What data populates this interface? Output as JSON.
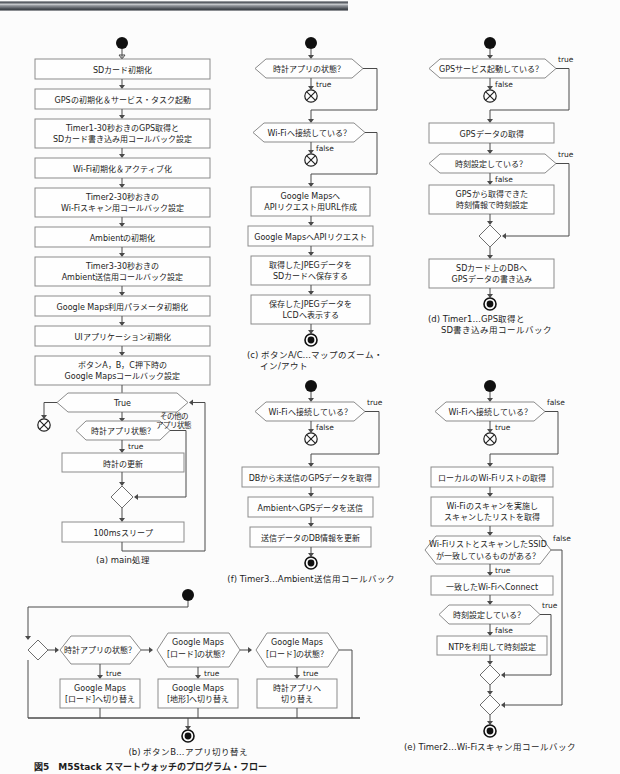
{
  "figure": {
    "number": "図5",
    "title": "M5Stack スマートウォッチのプログラム・フロー",
    "caption_full": "図5　M5Stack スマートウォッチのプログラム・フロー"
  },
  "diagram": {
    "type": "flowchart",
    "notation": "UML activity diagram",
    "panels": [
      {
        "id": "a",
        "label": "(a) main処理",
        "label_prefix": "(a)",
        "label_text": "main処理",
        "nodes": [
          {
            "kind": "start",
            "text": ""
          },
          {
            "kind": "action",
            "text": "SDカード初期化"
          },
          {
            "kind": "action",
            "text": "GPSの初期化＆サービス・タスク起動"
          },
          {
            "kind": "action",
            "text": "Timer1-30秒おきのGPS取得と\nSDカード書き込み用コールバック設定",
            "line1": "Timer1-30秒おきのGPS取得と",
            "line2": "SDカード書き込み用コールバック設定"
          },
          {
            "kind": "action",
            "text": "Wi-Fi初期化＆アクティブ化"
          },
          {
            "kind": "action",
            "text": "Timer2-30秒おきの\nWi-Fiスキャン用コールバック設定",
            "line1": "Timer2-30秒おきの",
            "line2": "Wi-Fiスキャン用コールバック設定"
          },
          {
            "kind": "action",
            "text": "Ambientの初期化"
          },
          {
            "kind": "action",
            "text": "Timer3-30秒おきの\nAmbient送信用コールバック設定",
            "line1": "Timer3-30秒おきの",
            "line2": "Ambient送信用コールバック設定"
          },
          {
            "kind": "action",
            "text": "Google Maps利用パラメータ初期化"
          },
          {
            "kind": "action",
            "text": "UIアプリケーション初期化"
          },
          {
            "kind": "action",
            "text": "ボタンA，B，C押下時の\nGoogle Mapsコールバック設定",
            "line1": "ボタンA，B，C押下時の",
            "line2": "Google Mapsコールバック設定"
          },
          {
            "kind": "decision",
            "text": "True"
          },
          {
            "kind": "decision",
            "text": "時計アプリ状態？"
          },
          {
            "kind": "action",
            "text": "時計の更新"
          },
          {
            "kind": "merge",
            "text": ""
          },
          {
            "kind": "action",
            "text": "100msスリープ"
          }
        ],
        "edge_labels": [
          {
            "text": "その他の",
            "role": "branch-false-line1"
          },
          {
            "text": "アプリ状態",
            "role": "branch-false-line2"
          },
          {
            "text": "true",
            "role": "branch-true"
          }
        ]
      },
      {
        "id": "b",
        "label": "(b) ボタンB…アプリ切り替え",
        "label_prefix": "(b)",
        "label_text": "ボタンB…アプリ切り替え",
        "nodes": [
          {
            "kind": "start",
            "text": ""
          },
          {
            "kind": "merge",
            "text": ""
          },
          {
            "kind": "decision",
            "text": "時計アプリの状態？"
          },
          {
            "kind": "decision",
            "text": "Google Maps\n[ロード]の状態？",
            "line1": "Google Maps",
            "line2": "[ロード]の状態？"
          },
          {
            "kind": "decision",
            "text": "Google Maps\n[ロード]の状態？",
            "line1": "Google Maps",
            "line2": "[ロード]の状態？"
          },
          {
            "kind": "action",
            "text": "Google Maps\n[ロード]へ切り替え",
            "line1": "Google Maps",
            "line2": "[ロード]へ切り替え"
          },
          {
            "kind": "action",
            "text": "Google Maps\n[地形]へ切り替え",
            "line1": "Google Maps",
            "line2": "[地形]へ切り替え"
          },
          {
            "kind": "action",
            "text": "時計アプリへ\n切り替え",
            "line1": "時計アプリへ",
            "line2": "切り替え"
          },
          {
            "kind": "end",
            "text": ""
          }
        ],
        "edge_labels": [
          {
            "text": "true",
            "role": "branch-true-1"
          },
          {
            "text": "true",
            "role": "branch-true-2"
          },
          {
            "text": "true",
            "role": "branch-true-3"
          }
        ]
      },
      {
        "id": "c",
        "label": "(c) ボタンA/C…マップのズーム・イン/アウト",
        "label_prefix": "(c)",
        "label_text_line1": "ボタンA/C…マップのズーム・",
        "label_text_line2": "イン/アウト",
        "nodes": [
          {
            "kind": "start",
            "text": ""
          },
          {
            "kind": "decision",
            "text": "時計アプリの状態？"
          },
          {
            "kind": "stop",
            "text": ""
          },
          {
            "kind": "decision",
            "text": "Wi-Fiへ接続している？"
          },
          {
            "kind": "stop",
            "text": ""
          },
          {
            "kind": "action",
            "text": "Google Mapsへ\nAPIリクエスト用URL作成",
            "line1": "Google Mapsへ",
            "line2": "APIリクエスト用URL作成"
          },
          {
            "kind": "action",
            "text": "Google MapsへAPIリクエスト"
          },
          {
            "kind": "action",
            "text": "取得したJPEGデータを\nSDカードへ保存する",
            "line1": "取得したJPEGデータを",
            "line2": "SDカードへ保存する"
          },
          {
            "kind": "action",
            "text": "保存したJPEGデータを\nLCDへ表示する",
            "line1": "保存したJPEGデータを",
            "line2": "LCDへ表示する"
          },
          {
            "kind": "end",
            "text": ""
          }
        ],
        "edge_labels": [
          {
            "text": "true",
            "role": "branch-1"
          },
          {
            "text": "false",
            "role": "branch-2"
          }
        ]
      },
      {
        "id": "d",
        "label": "(d) Timer1…GPS取得とSD書き込み用コールバック",
        "label_prefix": "(d)",
        "label_text_line1": "Timer1…GPS取得と",
        "label_text_line2": "SD書き込み用コールバック",
        "nodes": [
          {
            "kind": "start",
            "text": ""
          },
          {
            "kind": "decision",
            "text": "GPSサービス起動している？"
          },
          {
            "kind": "stop",
            "text": ""
          },
          {
            "kind": "action",
            "text": "GPSデータの取得"
          },
          {
            "kind": "decision",
            "text": "時刻設定している？"
          },
          {
            "kind": "action",
            "text": "GPSから取得できた\n時刻情報で時刻設定",
            "line1": "GPSから取得できた",
            "line2": "時刻情報で時刻設定"
          },
          {
            "kind": "merge",
            "text": ""
          },
          {
            "kind": "action",
            "text": "SDカード上のDBへ\nGPSデータの書き込み",
            "line1": "SDカード上のDBへ",
            "line2": "GPSデータの書き込み"
          },
          {
            "kind": "end",
            "text": ""
          }
        ],
        "edge_labels": [
          {
            "text": "true",
            "role": "branch-1-true"
          },
          {
            "text": "false",
            "role": "branch-1-false"
          },
          {
            "text": "true",
            "role": "branch-2-true"
          },
          {
            "text": "false",
            "role": "branch-2-false"
          }
        ]
      },
      {
        "id": "e",
        "label": "(e) Timer2…Wi-Fiスキャン用コールバック",
        "label_prefix": "(e)",
        "label_text": "Timer2…Wi-Fiスキャン用コールバック",
        "nodes": [
          {
            "kind": "start",
            "text": ""
          },
          {
            "kind": "decision",
            "text": "Wi-Fiへ接続している？"
          },
          {
            "kind": "stop",
            "text": ""
          },
          {
            "kind": "action",
            "text": "ローカルのWi-Fiリストの取得"
          },
          {
            "kind": "action",
            "text": "Wi-Fiのスキャンを実施し\nスキャンしたリストを取得",
            "line1": "Wi-Fiのスキャンを実施し",
            "line2": "スキャンしたリストを取得"
          },
          {
            "kind": "decision",
            "text": "Wi-Fiリストとスキャンしたssid\nが一致しているものがある？",
            "line1": "Wi-FiリストとスキャンしたSSID",
            "line2": "が一致しているものがある？"
          },
          {
            "kind": "action",
            "text": "一致したWi-FiへConnect"
          },
          {
            "kind": "decision",
            "text": "時刻設定している？"
          },
          {
            "kind": "action",
            "text": "NTPを利用して時刻設定"
          },
          {
            "kind": "merge",
            "text": ""
          },
          {
            "kind": "merge",
            "text": ""
          },
          {
            "kind": "end",
            "text": ""
          }
        ],
        "edge_labels": [
          {
            "text": "false",
            "role": "branch-1-false"
          },
          {
            "text": "true",
            "role": "branch-1-true"
          },
          {
            "text": "false",
            "role": "branch-2-false"
          },
          {
            "text": "true",
            "role": "branch-2-true"
          },
          {
            "text": "true",
            "role": "branch-3-true"
          },
          {
            "text": "false",
            "role": "branch-3-false"
          }
        ]
      },
      {
        "id": "f",
        "label": "(f) Timer3…Ambient送信用コールバック",
        "label_prefix": "(f)",
        "label_text": "Timer3…Ambient送信用コールバック",
        "nodes": [
          {
            "kind": "start",
            "text": ""
          },
          {
            "kind": "decision",
            "text": "Wi-Fiへ接続している？"
          },
          {
            "kind": "stop",
            "text": ""
          },
          {
            "kind": "action",
            "text": "DBから未送信のGPSデータを取得"
          },
          {
            "kind": "action",
            "text": "AmbientへGPSデータを送信"
          },
          {
            "kind": "action",
            "text": "送信データのDB情報を更新"
          },
          {
            "kind": "end",
            "text": ""
          }
        ],
        "edge_labels": [
          {
            "text": "true",
            "role": "branch-true"
          },
          {
            "text": "false",
            "role": "branch-false"
          }
        ]
      }
    ]
  },
  "text": {
    "a_box1": "SDカード初期化",
    "a_box2": "GPSの初期化＆サービス・タスク起動",
    "a_box3_l1": "Timer1-30秒おきのGPS取得と",
    "a_box3_l2": "SDカード書き込み用コールバック設定",
    "a_box4": "Wi-Fi初期化＆アクティブ化",
    "a_box5_l1": "Timer2-30秒おきの",
    "a_box5_l2": "Wi-Fiスキャン用コールバック設定",
    "a_box6": "Ambientの初期化",
    "a_box7_l1": "Timer3-30秒おきの",
    "a_box7_l2": "Ambient送信用コールバック設定",
    "a_box8": "Google Maps利用パラメータ初期化",
    "a_box9": "UIアプリケーション初期化",
    "a_box10_l1": "ボタンA，B，C押下時の",
    "a_box10_l2": "Google Mapsコールバック設定",
    "a_dec1": "True",
    "a_dec2": "時計アプリ状態？",
    "a_box11": "時計の更新",
    "a_box12": "100msスリープ",
    "a_lbl_other1": "その他の",
    "a_lbl_other2": "アプリ状態",
    "a_lbl_true": "true",
    "a_caption": "(a) main処理",
    "c_dec1": "時計アプリの状態？",
    "c_lbl1": "true",
    "c_dec2": "Wi-Fiへ接続している？",
    "c_lbl2": "false",
    "c_box1_l1": "Google Mapsへ",
    "c_box1_l2": "APIリクエスト用URL作成",
    "c_box2": "Google MapsへAPIリクエスト",
    "c_box3_l1": "取得したJPEGデータを",
    "c_box3_l2": "SDカードへ保存する",
    "c_box4_l1": "保存したJPEGデータを",
    "c_box4_l2": "LCDへ表示する",
    "c_caption_l1": "(c) ボタンA/C…マップのズーム・",
    "c_caption_l2": "イン/アウト",
    "d_dec1": "GPSサービス起動している？",
    "d_lbl1_true": "true",
    "d_lbl1_false": "false",
    "d_box1": "GPSデータの取得",
    "d_dec2": "時刻設定している？",
    "d_lbl2_true": "true",
    "d_lbl2_false": "false",
    "d_box2_l1": "GPSから取得できた",
    "d_box2_l2": "時刻情報で時刻設定",
    "d_box3_l1": "SDカード上のDBへ",
    "d_box3_l2": "GPSデータの書き込み",
    "d_caption_l1": "(d) Timer1…GPS取得と",
    "d_caption_l2": "SD書き込み用コールバック",
    "f_dec1": "Wi-Fiへ接続している？",
    "f_lbl_true": "true",
    "f_lbl_false": "false",
    "f_box1": "DBから未送信のGPSデータを取得",
    "f_box2": "AmbientへGPSデータを送信",
    "f_box3": "送信データのDB情報を更新",
    "f_caption": "(f) Timer3…Ambient送信用コールバック",
    "e_dec1": "Wi-Fiへ接続している？",
    "e_lbl1_false": "false",
    "e_lbl1_true": "true",
    "e_box1": "ローカルのWi-Fiリストの取得",
    "e_box2_l1": "Wi-Fiのスキャンを実施し",
    "e_box2_l2": "スキャンしたリストを取得",
    "e_dec2_l1": "Wi-FiリストとスキャンしたSSID",
    "e_dec2_l2": "が一致しているものがある？",
    "e_lbl2_false": "false",
    "e_lbl2_true": "true",
    "e_box3": "一致したWi-FiへConnect",
    "e_dec3": "時刻設定している？",
    "e_lbl3_true": "true",
    "e_lbl3_false": "false",
    "e_box4": "NTPを利用して時刻設定",
    "e_caption": "(e) Timer2…Wi-Fiスキャン用コールバック",
    "b_dec1": "時計アプリの状態？",
    "b_dec2_l1": "Google Maps",
    "b_dec2_l2": "[ロード]の状態？",
    "b_dec3_l1": "Google Maps",
    "b_dec3_l2": "[ロード]の状態？",
    "b_lbl1": "true",
    "b_lbl2": "true",
    "b_lbl3": "true",
    "b_box1_l1": "Google Maps",
    "b_box1_l2": "[ロード]へ切り替え",
    "b_box2_l1": "Google Maps",
    "b_box2_l2": "[地形]へ切り替え",
    "b_box3_l1": "時計アプリへ",
    "b_box3_l2": "切り替え",
    "b_caption": "(b) ボタンB…アプリ切り替え",
    "fig_caption": "図5　M5Stack スマートウォッチのプログラム・フロー"
  },
  "colors": {
    "node_fill": "#fefefe",
    "node_stroke": "#8b8b8b",
    "connector": "#4a4a4a",
    "text": "#1c1c1c",
    "page_bg": "#fcfcfc"
  }
}
